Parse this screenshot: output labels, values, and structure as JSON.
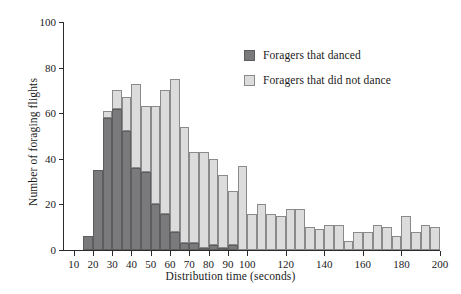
{
  "chart_data": {
    "type": "bar",
    "subtype": "stacked-histogram",
    "title": "",
    "xlabel": "Distribution time (seconds)",
    "ylabel": "Number of foraging flights",
    "xlim": [
      5,
      200
    ],
    "ylim": [
      0,
      100
    ],
    "bin_width": 5,
    "grid": false,
    "legend_position": "upper-right",
    "x_ticks": [
      10,
      20,
      30,
      40,
      50,
      60,
      70,
      80,
      90,
      100,
      120,
      140,
      160,
      180,
      200
    ],
    "x_tick_labels": [
      "10",
      "20",
      "30",
      "40",
      "50",
      "60",
      "70",
      "80",
      "90",
      "100",
      "120",
      "140",
      "160",
      "180",
      "200"
    ],
    "y_ticks": [
      0,
      20,
      40,
      60,
      80,
      100
    ],
    "y_tick_labels": [
      "0",
      "20",
      "40",
      "60",
      "80",
      "100"
    ],
    "bin_starts": [
      15,
      20,
      25,
      30,
      35,
      40,
      45,
      50,
      55,
      60,
      65,
      70,
      75,
      80,
      85,
      90,
      95,
      100,
      105,
      110,
      115,
      120,
      125,
      130,
      135,
      140,
      145,
      150,
      155,
      160,
      165,
      170,
      175,
      180,
      185,
      190,
      195
    ],
    "series": [
      {
        "name": "Foragers that danced",
        "color": "#7a7a7c",
        "values": [
          6,
          35,
          58,
          62,
          52,
          36,
          34,
          20,
          16,
          8,
          3,
          3,
          1,
          2,
          1,
          2,
          0,
          0,
          0,
          0,
          0,
          0,
          0,
          0,
          0,
          0,
          0,
          0,
          0,
          0,
          0,
          0,
          0,
          0,
          0,
          0,
          0
        ]
      },
      {
        "name": "Foragers that did not dance",
        "color": "#dcdcdc",
        "values": [
          0,
          0,
          3,
          8,
          15,
          37,
          29,
          43,
          54,
          67,
          51,
          40,
          42,
          38,
          32,
          24,
          37,
          16,
          20,
          16,
          15,
          18,
          18,
          10,
          9,
          11,
          11,
          4,
          8,
          8,
          11,
          10,
          6,
          15,
          8,
          11,
          10,
          5
        ]
      }
    ],
    "totals": [
      6,
      35,
      61,
      70,
      67,
      73,
      63,
      70,
      75,
      59,
      43,
      45,
      40,
      34,
      26,
      39,
      16,
      20,
      16,
      15,
      18,
      18,
      10,
      9,
      11,
      11,
      4,
      8,
      8,
      11,
      10,
      6,
      15,
      8,
      11,
      10,
      5
    ]
  },
  "legend": {
    "items": [
      {
        "label": "Foragers that danced",
        "swatch": "dark"
      },
      {
        "label": "Foragers that did not dance",
        "swatch": "light"
      }
    ]
  }
}
